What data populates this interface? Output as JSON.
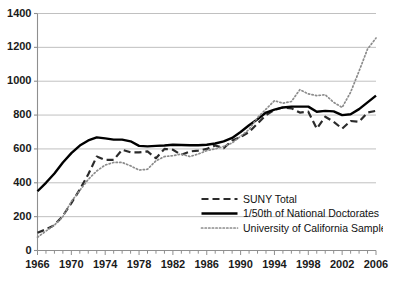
{
  "chart_data": {
    "type": "line",
    "title": "",
    "xlabel": "",
    "ylabel": "",
    "xlim": [
      1966,
      2006
    ],
    "ylim": [
      0,
      1400
    ],
    "ytick_step": 200,
    "xtick_label_step": 4,
    "xtick_minor_step": 1,
    "grid": "horizontal",
    "legend_position": "inside-bottom-right",
    "ytick_labels": [
      "0",
      "200",
      "400",
      "600",
      "800",
      "1000",
      "1200",
      "1400"
    ],
    "ytick_values": [
      0,
      200,
      400,
      600,
      800,
      1000,
      1200,
      1400
    ],
    "xtick_labels": [
      "1966",
      "1970",
      "1974",
      "1978",
      "1982",
      "1986",
      "1990",
      "1994",
      "1998",
      "2002",
      "2006"
    ],
    "xtick_values": [
      1966,
      1970,
      1974,
      1978,
      1982,
      1986,
      1990,
      1994,
      1998,
      2002,
      2006
    ],
    "x": [
      1966,
      1967,
      1968,
      1969,
      1970,
      1971,
      1972,
      1973,
      1974,
      1975,
      1976,
      1977,
      1978,
      1979,
      1980,
      1981,
      1982,
      1983,
      1984,
      1985,
      1986,
      1987,
      1988,
      1989,
      1990,
      1991,
      1992,
      1993,
      1994,
      1995,
      1996,
      1997,
      1998,
      1999,
      2000,
      2001,
      2002,
      2003,
      2004,
      2005,
      2006
    ],
    "series": [
      {
        "name": "SUNY Total",
        "style": "dashed",
        "color": "#2b2b2b",
        "values": [
          105,
          125,
          150,
          205,
          280,
          360,
          450,
          555,
          535,
          535,
          595,
          580,
          580,
          585,
          545,
          600,
          595,
          565,
          585,
          590,
          600,
          620,
          605,
          650,
          670,
          700,
          750,
          800,
          830,
          845,
          840,
          815,
          820,
          720,
          790,
          760,
          720,
          765,
          760,
          815,
          825
        ]
      },
      {
        "name": "1/50th of National Doctorates",
        "style": "solid",
        "color": "#000000",
        "values": [
          350,
          400,
          455,
          520,
          575,
          620,
          650,
          668,
          662,
          655,
          655,
          645,
          618,
          615,
          618,
          620,
          625,
          623,
          622,
          622,
          625,
          632,
          645,
          665,
          700,
          740,
          775,
          815,
          832,
          845,
          850,
          850,
          850,
          820,
          825,
          822,
          800,
          805,
          835,
          875,
          915
        ]
      },
      {
        "name": "University of California Sample",
        "style": "dotted",
        "color": "#8c8c8c",
        "values": [
          78,
          115,
          150,
          200,
          290,
          355,
          420,
          470,
          505,
          520,
          520,
          500,
          475,
          480,
          530,
          555,
          560,
          570,
          555,
          570,
          590,
          600,
          615,
          635,
          675,
          715,
          785,
          835,
          885,
          870,
          880,
          950,
          925,
          915,
          920,
          875,
          845,
          935,
          1060,
          1190,
          1255
        ]
      }
    ]
  },
  "legend": {
    "items": [
      {
        "label": "SUNY Total",
        "style": "dashed"
      },
      {
        "label": "1/50th of National Doctorates",
        "style": "solid"
      },
      {
        "label": "University of California Sample",
        "style": "dotted"
      }
    ]
  }
}
